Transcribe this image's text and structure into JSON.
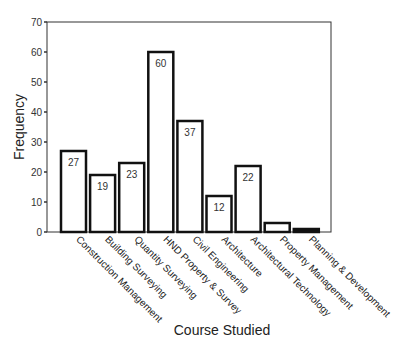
{
  "chart_data": {
    "type": "bar",
    "title": "",
    "xlabel": "Course Studied",
    "ylabel": "Frequency",
    "ylim": [
      0,
      70
    ],
    "yticks": [
      0,
      10,
      20,
      30,
      40,
      50,
      60,
      70
    ],
    "grid": false,
    "legend": null,
    "categories": [
      "Construction Management",
      "Building Surveying",
      "Quantity Surveying",
      "HND Property & Survey",
      "Civil Engineering",
      "Architecture",
      "Architectural Technology",
      "Property Management",
      "Planning & Development"
    ],
    "values": [
      27,
      19,
      23,
      60,
      37,
      12,
      22,
      3,
      1
    ],
    "data_labels": [
      "27",
      "19",
      "23",
      "60",
      "37",
      "12",
      "22",
      "",
      ""
    ]
  },
  "colors": {
    "bar_fill": "#ffffff",
    "bar_stroke": "#111111",
    "axis": "#333333"
  }
}
